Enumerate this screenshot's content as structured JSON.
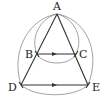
{
  "diagram": {
    "type": "geometry",
    "colors": {
      "edge": "#333333",
      "arc": "#8a8a8a",
      "label": "#222222"
    },
    "points": {
      "A": {
        "label": "A",
        "x": 57,
        "y": 14
      },
      "B": {
        "label": "B",
        "x": 37,
        "y": 54
      },
      "C": {
        "label": "C",
        "x": 76,
        "y": 54
      },
      "D": {
        "label": "D",
        "x": 21,
        "y": 85
      },
      "E": {
        "label": "E",
        "x": 88,
        "y": 85
      }
    },
    "segments": [
      {
        "from": "A",
        "to": "D"
      },
      {
        "from": "A",
        "to": "E"
      },
      {
        "from": "B",
        "to": "C",
        "arrow": true
      },
      {
        "from": "D",
        "to": "E",
        "arrow": true
      }
    ],
    "arcs": [
      {
        "from": "A",
        "to": "B"
      },
      {
        "from": "A",
        "to": "C"
      },
      {
        "from": "A",
        "to": "D"
      },
      {
        "from": "A",
        "to": "E"
      },
      {
        "from": "B",
        "to": "C"
      },
      {
        "from": "D",
        "to": "E"
      }
    ]
  }
}
